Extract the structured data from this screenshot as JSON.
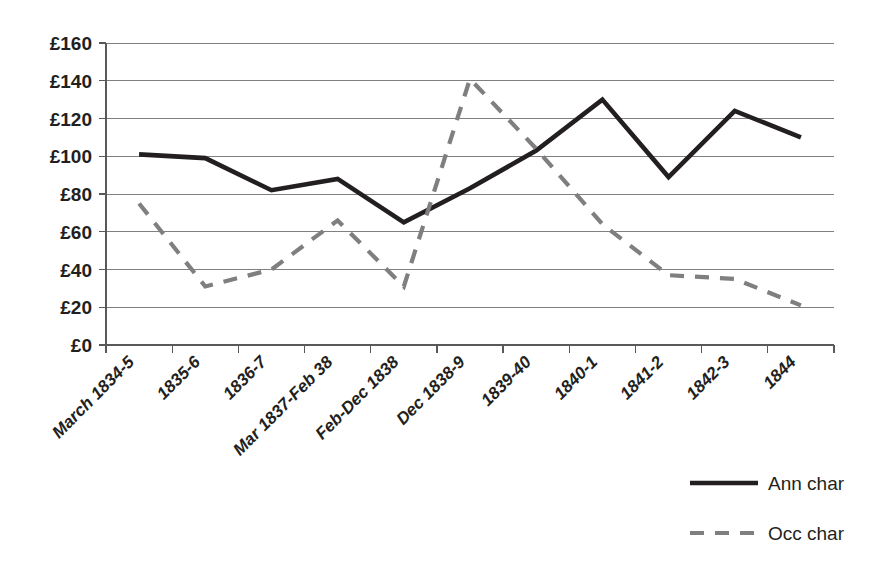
{
  "chart_data": {
    "type": "line",
    "title": "",
    "xlabel": "",
    "ylabel": "",
    "categories": [
      "March 1834-5",
      "1835-6",
      "1836-7",
      "Mar 1837-Feb 38",
      "Feb-Dec 1838",
      "Dec 1838-9",
      "1839-40",
      "1840-1",
      "1841-2",
      "1842-3",
      "1844"
    ],
    "series": [
      {
        "name": "Ann char",
        "style": "solid",
        "color": "#231f20",
        "values": [
          101,
          99,
          82,
          88,
          65,
          83,
          103,
          130,
          89,
          124,
          110
        ]
      },
      {
        "name": "Occ char",
        "style": "dashed",
        "color": "#7f7f7f",
        "values": [
          75,
          31,
          40,
          66,
          31,
          141,
          104,
          64,
          37,
          35,
          21
        ]
      }
    ],
    "ylim": [
      0,
      160
    ],
    "ytick_step": 20,
    "ytick_labels": [
      "£0",
      "£20",
      "£40",
      "£60",
      "£80",
      "£100",
      "£120",
      "£140",
      "£160"
    ],
    "ytick_values": [
      0,
      20,
      40,
      60,
      80,
      100,
      120,
      140,
      160
    ],
    "currency_symbol": "£",
    "grid": true,
    "grid_axis": "y",
    "legend_position": "bottom-right"
  },
  "legend": {
    "entries": [
      {
        "label": "Ann char",
        "style": "solid",
        "color": "#231f20"
      },
      {
        "label": "Occ char",
        "style": "dashed",
        "color": "#7f7f7f"
      }
    ]
  }
}
